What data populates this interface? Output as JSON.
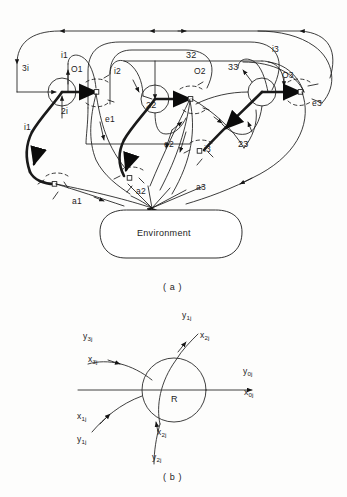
{
  "figure": {
    "panel_a": {
      "caption": "( a )",
      "environment_label": "Environment",
      "node_labels": [
        {
          "id": "n1-in-3",
          "text": "3i",
          "x": 22,
          "y": 68
        },
        {
          "id": "n1-in-1",
          "text": "i1",
          "x": 61,
          "y": 55
        },
        {
          "id": "n1-out",
          "text": "O1",
          "x": 72,
          "y": 68
        },
        {
          "id": "n1-in-2",
          "text": "2i",
          "x": 61,
          "y": 110
        },
        {
          "id": "n1-env-in",
          "text": "i1",
          "x": 24,
          "y": 125
        },
        {
          "id": "n1-env-out",
          "text": "e1",
          "x": 105,
          "y": 118
        },
        {
          "id": "n1-act",
          "text": "a1",
          "x": 72,
          "y": 200
        },
        {
          "id": "n2-in-1",
          "text": "i2",
          "x": 114,
          "y": 70
        },
        {
          "id": "n2-in-top",
          "text": "32",
          "x": 189,
          "y": 52
        },
        {
          "id": "n2-out",
          "text": "O2",
          "x": 194,
          "y": 70
        },
        {
          "id": "n2-in-2",
          "text": "22",
          "x": 147,
          "y": 103
        },
        {
          "id": "n2-env-out",
          "text": "e2",
          "x": 164,
          "y": 143
        },
        {
          "id": "n2-act",
          "text": "a2",
          "x": 136,
          "y": 190
        },
        {
          "id": "n3-in-1",
          "text": "i3",
          "x": 272,
          "y": 47
        },
        {
          "id": "n3-in-3",
          "text": "33",
          "x": 229,
          "y": 66
        },
        {
          "id": "n3-out",
          "text": "O3",
          "x": 283,
          "y": 73
        },
        {
          "id": "n3-in-2",
          "text": "23",
          "x": 239,
          "y": 143
        },
        {
          "id": "n3-env-in",
          "text": "i3",
          "x": 202,
          "y": 148
        },
        {
          "id": "n3-env-out",
          "text": "e3",
          "x": 313,
          "y": 102
        },
        {
          "id": "n3-act",
          "text": "a3",
          "x": 196,
          "y": 186
        }
      ]
    },
    "panel_b": {
      "caption": "( b )",
      "center_label": "R",
      "port_labels": [
        {
          "id": "y1j",
          "base": "y",
          "sub": "1j",
          "x": 182,
          "y": 316
        },
        {
          "id": "x2j-top",
          "base": "x",
          "sub": "2j",
          "x": 200,
          "y": 336
        },
        {
          "id": "y3j",
          "base": "y",
          "sub": "3j",
          "x": 83,
          "y": 337
        },
        {
          "id": "x3j",
          "base": "x",
          "sub": "3j",
          "x": 88,
          "y": 360
        },
        {
          "id": "y0j",
          "base": "y",
          "sub": "0j",
          "x": 243,
          "y": 372
        },
        {
          "id": "x0j",
          "base": "x",
          "sub": "0j",
          "x": 244,
          "y": 393
        },
        {
          "id": "x1j",
          "base": "x",
          "sub": "1j",
          "x": 77,
          "y": 417
        },
        {
          "id": "y1j-lower",
          "base": "y",
          "sub": "1j",
          "x": 77,
          "y": 440
        },
        {
          "id": "x2j-bottom",
          "base": "x",
          "sub": "2j",
          "x": 157,
          "y": 433
        },
        {
          "id": "y2j",
          "base": "y",
          "sub": "2j",
          "x": 152,
          "y": 458
        }
      ]
    }
  }
}
